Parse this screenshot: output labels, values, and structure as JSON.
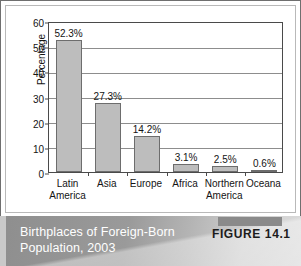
{
  "figure": {
    "caption_line1": "Birthplaces of Foreign-Born",
    "caption_line2": "Population, 2003",
    "figure_number": "FIGURE 14.1"
  },
  "colors": {
    "bar_fill": "#bdbdbd",
    "bar_border": "#6d6d6d",
    "axis": "#4a4a4a",
    "gridline": "#8d8d8d",
    "caption_text": "#ffffff"
  },
  "chart_data": {
    "type": "bar",
    "title": "Birthplaces of Foreign-Born Population, 2003",
    "xlabel": "",
    "ylabel": "Percentage",
    "categories": [
      "Latin America",
      "Asia",
      "Europe",
      "Africa",
      "Northern America",
      "Oceana"
    ],
    "category_lines": [
      [
        "Latin",
        "America"
      ],
      [
        "Asia",
        ""
      ],
      [
        "Europe",
        ""
      ],
      [
        "Africa",
        ""
      ],
      [
        "Northern",
        "America"
      ],
      [
        "Oceana",
        ""
      ]
    ],
    "values": [
      52.3,
      27.3,
      14.2,
      3.1,
      2.5,
      0.6
    ],
    "data_labels": [
      "52.3%",
      "27.3%",
      "14.2%",
      "3.1%",
      "2.5%",
      "0.6%"
    ],
    "ylim": [
      0,
      60
    ],
    "yticks": [
      0,
      10,
      20,
      30,
      40,
      50,
      60
    ],
    "ytick_labels": [
      "0",
      "10",
      "20",
      "30",
      "40",
      "50",
      "60"
    ],
    "grid": true,
    "grid_axis": "y",
    "legend": false,
    "legend_position": "none"
  }
}
